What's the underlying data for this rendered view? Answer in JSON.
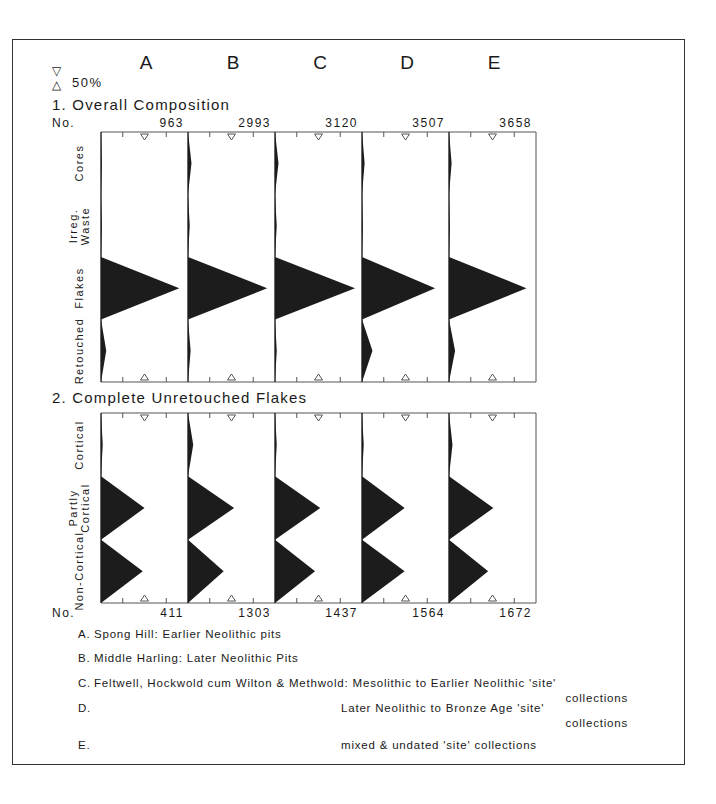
{
  "columns": [
    "A",
    "B",
    "C",
    "D",
    "E"
  ],
  "key": {
    "down_symbol": "▽",
    "up_symbol": "△",
    "label": "50%"
  },
  "section1": {
    "title": "1. Overall Composition",
    "no_label": "No.",
    "totals": [
      "963",
      "2993",
      "3120",
      "3507",
      "3658"
    ],
    "categories": [
      "Cores",
      "Irreg. Waste",
      "Flakes",
      "Retouched"
    ]
  },
  "section2": {
    "title": "2. Complete Unretouched Flakes",
    "no_label": "No.",
    "totals": [
      "411",
      "1303",
      "1437",
      "1564",
      "1672"
    ],
    "categories": [
      "Cortical",
      "Partly Cortical",
      "Non-Cortical"
    ]
  },
  "legend": [
    {
      "key": "A.",
      "text": "Spong Hill: Earlier Neolithic pits"
    },
    {
      "key": "B.",
      "text": "Middle Harling: Later Neolithic Pits"
    },
    {
      "key": "C.",
      "text": "Feltwell, Hockwold cum Wilton & Methwold: Mesolithic to Earlier Neolithic 'site'",
      "cont": "collections"
    },
    {
      "key": "D.",
      "text": "Later Neolithic to Bronze Age 'site'",
      "cont": "collections"
    },
    {
      "key": "E.",
      "text": "mixed & undated 'site' collections"
    }
  ],
  "chart_data": [
    {
      "type": "area",
      "title": "1. Overall Composition",
      "orientation": "battleship (horizontal percentage polygons)",
      "categories": [
        "Cores",
        "Irreg. Waste",
        "Flakes",
        "Retouched"
      ],
      "xlim": [
        0,
        100
      ],
      "marker_50pct": true,
      "series": [
        {
          "name": "A",
          "n": 963,
          "values": [
            1,
            1,
            90,
            6
          ]
        },
        {
          "name": "B",
          "n": 2993,
          "values": [
            4,
            2,
            91,
            3
          ]
        },
        {
          "name": "C",
          "n": 3120,
          "values": [
            4,
            2,
            92,
            2
          ]
        },
        {
          "name": "D",
          "n": 3507,
          "values": [
            3,
            1,
            84,
            12
          ]
        },
        {
          "name": "E",
          "n": 3658,
          "values": [
            3,
            1,
            89,
            7
          ]
        }
      ]
    },
    {
      "type": "area",
      "title": "2. Complete Unretouched Flakes",
      "orientation": "battleship (horizontal percentage polygons)",
      "categories": [
        "Cortical",
        "Partly Cortical",
        "Non-Cortical"
      ],
      "xlim": [
        0,
        100
      ],
      "marker_50pct": true,
      "series": [
        {
          "name": "A",
          "n": 411,
          "values": [
            2,
            50,
            48
          ]
        },
        {
          "name": "B",
          "n": 1303,
          "values": [
            6,
            53,
            41
          ]
        },
        {
          "name": "C",
          "n": 1437,
          "values": [
            2,
            52,
            46
          ]
        },
        {
          "name": "D",
          "n": 1564,
          "values": [
            2,
            49,
            49
          ]
        },
        {
          "name": "E",
          "n": 1672,
          "values": [
            4,
            51,
            45
          ]
        }
      ]
    }
  ]
}
